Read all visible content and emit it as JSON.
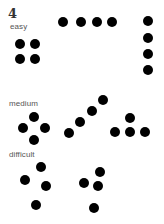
{
  "figure": {
    "number": "4",
    "dot_color": "#000000",
    "sections": [
      {
        "label": "easy",
        "label_pos": [
          10,
          23
        ],
        "groups": [
          {
            "name": "square",
            "dots": [
              [
                20,
                44
              ],
              [
                35,
                44
              ],
              [
                20,
                59
              ],
              [
                35,
                59
              ]
            ]
          },
          {
            "name": "horizontal-line",
            "dots": [
              [
                63,
                22
              ],
              [
                81,
                22
              ],
              [
                97,
                22
              ],
              [
                112,
                22
              ]
            ]
          },
          {
            "name": "vertical-line",
            "dots": [
              [
                148,
                21
              ],
              [
                148,
                38
              ],
              [
                148,
                54
              ],
              [
                148,
                70
              ]
            ]
          }
        ]
      },
      {
        "label": "medium",
        "label_pos": [
          9,
          100
        ],
        "groups": [
          {
            "name": "diamond",
            "dots": [
              [
                34,
                117
              ],
              [
                23,
                128
              ],
              [
                45,
                128
              ],
              [
                34,
                140
              ]
            ]
          },
          {
            "name": "diagonal-line",
            "dots": [
              [
                69,
                133
              ],
              [
                80,
                122
              ],
              [
                92,
                111
              ],
              [
                103,
                100
              ]
            ]
          },
          {
            "name": "triangle",
            "dots": [
              [
                130,
                118
              ],
              [
                115,
                132
              ],
              [
                130,
                132
              ],
              [
                145,
                132
              ]
            ]
          }
        ]
      },
      {
        "label": "difficult",
        "label_pos": [
          9,
          151
        ],
        "groups": [
          {
            "name": "irregular-left",
            "dots": [
              [
                41,
                167
              ],
              [
                25,
                180
              ],
              [
                46,
                186
              ],
              [
                36,
                205
              ]
            ]
          },
          {
            "name": "irregular-right",
            "dots": [
              [
                100,
                172
              ],
              [
                84,
                183
              ],
              [
                98,
                186
              ],
              [
                94,
                208
              ]
            ]
          }
        ]
      }
    ]
  }
}
